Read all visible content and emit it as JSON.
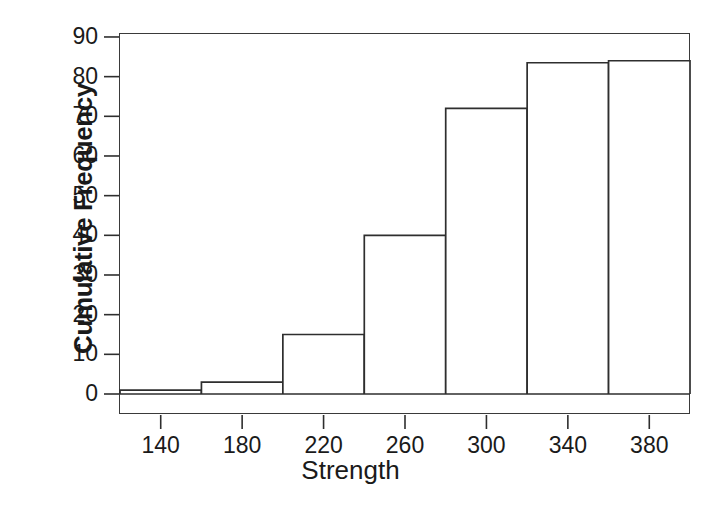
{
  "chart_data": {
    "type": "bar",
    "title": "",
    "subtitle": "",
    "xlabel": "Strength",
    "ylabel": "Cumulative Frequency",
    "categories": [
      "120-160",
      "160-200",
      "200-240",
      "240-280",
      "280-320",
      "320-360",
      "360-400"
    ],
    "bin_edges": [
      120,
      160,
      200,
      240,
      280,
      320,
      360,
      400
    ],
    "values": [
      1,
      3,
      15,
      40,
      72,
      83.5,
      84
    ],
    "x": [
      140,
      180,
      220,
      260,
      300,
      340,
      380
    ],
    "xlim": [
      120,
      400
    ],
    "ylim": [
      0,
      91
    ],
    "ytick_values": [
      0,
      10,
      20,
      30,
      40,
      50,
      60,
      70,
      80,
      90
    ],
    "ytick_labels": [
      "0",
      "10",
      "20",
      "30",
      "40",
      "50",
      "60",
      "70",
      "80",
      "90"
    ],
    "xtick_values": [
      140,
      180,
      220,
      260,
      300,
      340,
      380
    ],
    "xtick_labels": [
      "140",
      "180",
      "220",
      "260",
      "300",
      "340",
      "380"
    ],
    "grid": false,
    "legend": null,
    "legend_position": "none",
    "bar_fill_color": "#ffffff",
    "bar_edge_color": "#2e2e2e",
    "background_color": "#ffffff",
    "annotations": []
  },
  "figure": {
    "plot_title": "",
    "axis_color": "#2e2e2e",
    "text_color": "#1a1a1a"
  }
}
